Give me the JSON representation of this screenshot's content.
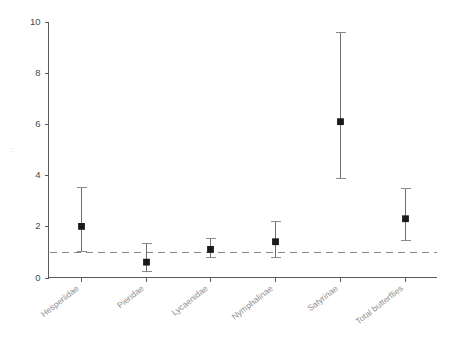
{
  "chart_data": {
    "type": "scatter",
    "title": "",
    "subtitle": "",
    "xlabel": "",
    "ylabel": "",
    "ylim": [
      0,
      10
    ],
    "yticks": [
      0,
      2,
      4,
      6,
      8,
      10
    ],
    "ytick_labels": [
      "0",
      "2",
      "4",
      "6",
      "8",
      "10"
    ],
    "grid": false,
    "legend": null,
    "categories": [
      "Hesperiidae",
      "Pieridae",
      "Lycaenidae",
      "Nymphalinae",
      "Satyrinae",
      "Total butterflies"
    ],
    "values": [
      2.0,
      0.6,
      1.1,
      1.4,
      6.1,
      2.3
    ],
    "error_low": [
      1.05,
      0.25,
      0.8,
      0.8,
      3.9,
      1.45
    ],
    "error_high": [
      3.55,
      1.35,
      1.55,
      2.2,
      9.6,
      3.5
    ],
    "reference_line": {
      "y": 1.0,
      "style": "dashed",
      "color": "#8a8a8a"
    },
    "series": [
      {
        "name": "Effect estimate",
        "marker": "square",
        "color": "#1a1a1a",
        "points": [
          {
            "category": "Hesperiidae",
            "value": 2.0,
            "low": 1.05,
            "high": 3.55
          },
          {
            "category": "Pieridae",
            "value": 0.6,
            "low": 0.25,
            "high": 1.35
          },
          {
            "category": "Lycaenidae",
            "value": 1.1,
            "low": 0.8,
            "high": 1.55
          },
          {
            "category": "Nymphalinae",
            "value": 1.4,
            "low": 0.8,
            "high": 2.2
          },
          {
            "category": "Satyrinae",
            "value": 6.1,
            "low": 3.9,
            "high": 9.6
          },
          {
            "category": "Total butterflies",
            "value": 2.3,
            "low": 1.45,
            "high": 3.5
          }
        ]
      }
    ]
  },
  "axis": {
    "y_faint_label": "::"
  },
  "colors": {
    "axis": "#5a5a5a",
    "marker": "#1a1a1a",
    "error_bar": "#6e6e6e",
    "reference": "#8a8a8a",
    "xtick_text": "#8f8f8f",
    "ytick_text": "#4a4a4a",
    "background": "#ffffff"
  }
}
